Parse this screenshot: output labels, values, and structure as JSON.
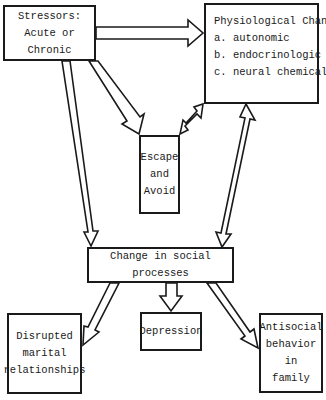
{
  "diagram": {
    "nodes": {
      "stressors": {
        "lines": [
          "Stressors:",
          "Acute or Chronic"
        ]
      },
      "physiological": {
        "title": "Physiological Change",
        "items": [
          "a. autonomic",
          "b. endocrinologic",
          "c. neural chemical"
        ]
      },
      "escape": {
        "lines": [
          "Escape",
          "and",
          "Avoid"
        ]
      },
      "social": {
        "lines": [
          "Change in social processes"
        ]
      },
      "disrupted": {
        "lines": [
          "Disrupted",
          "marital",
          "relationships"
        ]
      },
      "depression": {
        "lines": [
          "Depression"
        ]
      },
      "antisocial": {
        "lines": [
          "Antisocial",
          "behavior",
          "in",
          "family"
        ]
      }
    },
    "edges": [
      {
        "from": "stressors",
        "to": "physiological",
        "type": "single"
      },
      {
        "from": "stressors",
        "to": "escape",
        "type": "single"
      },
      {
        "from": "stressors",
        "to": "social",
        "type": "single"
      },
      {
        "from": "physiological",
        "to": "escape",
        "type": "double"
      },
      {
        "from": "physiological",
        "to": "social",
        "type": "double"
      },
      {
        "from": "social",
        "to": "disrupted",
        "type": "single"
      },
      {
        "from": "social",
        "to": "depression",
        "type": "single"
      },
      {
        "from": "social",
        "to": "antisocial",
        "type": "single"
      }
    ]
  },
  "colors": {
    "stroke": "#1a1a1a",
    "background": "#ffffff"
  }
}
